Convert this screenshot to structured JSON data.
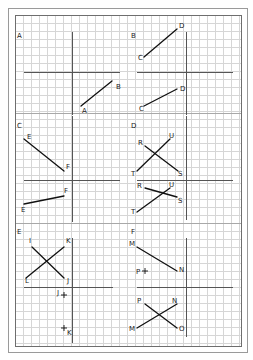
{
  "colors": {
    "background": "#ffffff",
    "outer_frame": "#9a9a9a",
    "grid_border": "#6e6e6e",
    "grid_line": "#d6d6d6",
    "panel_divider": "#a8a8a8",
    "axis": "#555555",
    "segment": "#111111"
  },
  "frame": {
    "outer": [
      8,
      8,
      247,
      352
    ],
    "grid": [
      15,
      15,
      241,
      346
    ],
    "grid_spacing": 8
  },
  "panel_dividers_y": [
    113,
    223
  ],
  "panels": [
    {
      "id": "A",
      "label": "A",
      "label_pos": [
        17,
        38
      ],
      "axes": {
        "v": [
          72,
          32,
          115
        ],
        "h": [
          72,
          24,
          120
        ]
      },
      "segments": [
        {
          "from": [
            81,
            106
          ],
          "to": [
            112,
            81
          ]
        }
      ],
      "points": [],
      "labels": [
        {
          "text": "B",
          "pos": [
            116,
            89
          ]
        },
        {
          "text": "A",
          "pos": [
            82,
            113
          ]
        }
      ]
    },
    {
      "id": "B",
      "label": "B",
      "label_pos": [
        131,
        38
      ],
      "axes": {
        "v": [
          186,
          32,
          115
        ],
        "h": [
          72,
          137,
          233
        ]
      },
      "segments": [
        {
          "from": [
            144,
            57
          ],
          "to": [
            177,
            29
          ]
        },
        {
          "from": [
            144,
            106
          ],
          "to": [
            177,
            89
          ]
        }
      ],
      "points": [],
      "labels": [
        {
          "text": "D",
          "pos": [
            179,
            28
          ]
        },
        {
          "text": "C",
          "pos": [
            138,
            60
          ]
        },
        {
          "text": "D",
          "pos": [
            180,
            91
          ]
        },
        {
          "text": "C",
          "pos": [
            139,
            111
          ]
        }
      ]
    },
    {
      "id": "C",
      "label": "C",
      "label_pos": [
        17,
        128
      ],
      "axes": {
        "v": [
          72,
          116,
          222
        ],
        "h": [
          180,
          24,
          120
        ]
      },
      "segments": [
        {
          "from": [
            24,
            139
          ],
          "to": [
            64,
            171
          ]
        },
        {
          "from": [
            24,
            204
          ],
          "to": [
            64,
            196
          ]
        }
      ],
      "points": [],
      "labels": [
        {
          "text": "E",
          "pos": [
            27,
            139
          ]
        },
        {
          "text": "F",
          "pos": [
            66,
            169
          ]
        },
        {
          "text": "F",
          "pos": [
            64,
            193
          ]
        },
        {
          "text": "E",
          "pos": [
            21,
            212
          ]
        }
      ]
    },
    {
      "id": "D",
      "label": "D",
      "label_pos": [
        131,
        128
      ],
      "axes": {
        "v": [
          186,
          116,
          220
        ],
        "h": [
          180,
          137,
          233
        ]
      },
      "segments": [
        {
          "from": [
            145,
            146
          ],
          "to": [
            178,
            171
          ]
        },
        {
          "from": [
            137,
            171
          ],
          "to": [
            170,
            139
          ]
        },
        {
          "from": [
            145,
            188
          ],
          "to": [
            177,
            197
          ]
        },
        {
          "from": [
            137,
            212
          ],
          "to": [
            170,
            188
          ]
        }
      ],
      "points": [],
      "labels": [
        {
          "text": "R",
          "pos": [
            138,
            145
          ]
        },
        {
          "text": "U",
          "pos": [
            169,
            138
          ]
        },
        {
          "text": "T",
          "pos": [
            131,
            176
          ]
        },
        {
          "text": "S",
          "pos": [
            178,
            176
          ]
        },
        {
          "text": "R",
          "pos": [
            137,
            188
          ]
        },
        {
          "text": "U",
          "pos": [
            169,
            187
          ]
        },
        {
          "text": "S",
          "pos": [
            178,
            203
          ]
        },
        {
          "text": "T",
          "pos": [
            131,
            214
          ]
        }
      ]
    },
    {
      "id": "E",
      "label": "E",
      "label_pos": [
        17,
        234
      ],
      "axes": {
        "v": [
          72,
          238,
          343
        ],
        "h": [
          287,
          24,
          113
        ]
      },
      "segments": [
        {
          "from": [
            32,
            247
          ],
          "to": [
            64,
            278
          ]
        },
        {
          "from": [
            26,
            278
          ],
          "to": [
            64,
            247
          ]
        }
      ],
      "points": [
        {
          "name": "J",
          "pos": [
            64,
            295
          ]
        },
        {
          "name": "K",
          "pos": [
            64,
            328
          ]
        }
      ],
      "labels": [
        {
          "text": "I",
          "pos": [
            29,
            243
          ]
        },
        {
          "text": "K",
          "pos": [
            66,
            243
          ]
        },
        {
          "text": "L",
          "pos": [
            25,
            283
          ]
        },
        {
          "text": "J",
          "pos": [
            67,
            283
          ]
        },
        {
          "text": "J",
          "pos": [
            57,
            295
          ]
        },
        {
          "text": "K",
          "pos": [
            67,
            335
          ]
        }
      ]
    },
    {
      "id": "F",
      "label": "F",
      "label_pos": [
        131,
        234
      ],
      "axes": {
        "v": [
          186,
          238,
          337
        ],
        "h": [
          287,
          137,
          233
        ]
      },
      "segments": [
        {
          "from": [
            137,
            247
          ],
          "to": [
            177,
            271
          ]
        },
        {
          "from": [
            145,
            304
          ],
          "to": [
            177,
            328
          ]
        },
        {
          "from": [
            137,
            328
          ],
          "to": [
            177,
            304
          ]
        }
      ],
      "points": [
        {
          "name": "P",
          "pos": [
            145,
            271
          ]
        }
      ],
      "labels": [
        {
          "text": "M",
          "pos": [
            129,
            246
          ]
        },
        {
          "text": "N",
          "pos": [
            179,
            272
          ]
        },
        {
          "text": "P",
          "pos": [
            136,
            274
          ]
        },
        {
          "text": "P",
          "pos": [
            137,
            303
          ]
        },
        {
          "text": "N",
          "pos": [
            172,
            303
          ]
        },
        {
          "text": "M",
          "pos": [
            129,
            331
          ]
        },
        {
          "text": "O",
          "pos": [
            179,
            331
          ]
        }
      ]
    }
  ]
}
